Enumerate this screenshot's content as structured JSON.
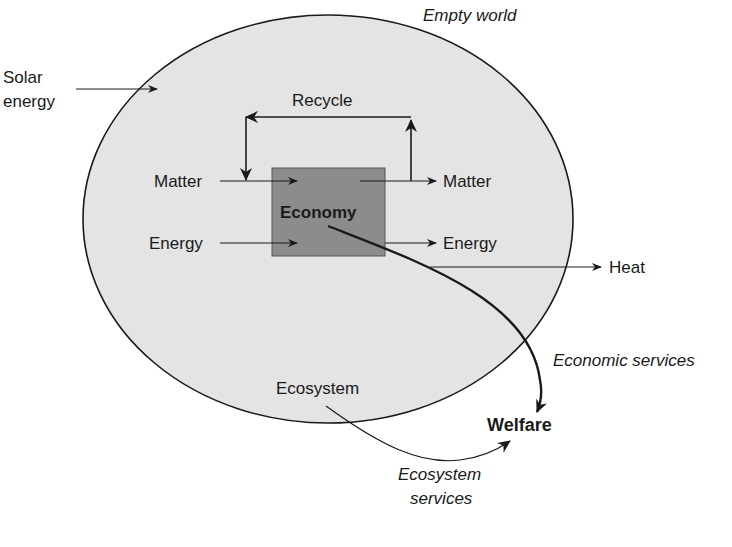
{
  "diagram": {
    "title": "Empty world",
    "colors": {
      "world_fill": "#e4e4e4",
      "economy_fill": "#8c8c8c",
      "stroke": "#1a1a1a"
    },
    "nodes": {
      "world": "Empty world",
      "economy": "Economy",
      "ecosystem": "Ecosystem",
      "welfare": "Welfare"
    },
    "labels": {
      "solar_line1": "Solar",
      "solar_line2": "energy",
      "recycle": "Recycle",
      "matter_in": "Matter",
      "matter_out": "Matter",
      "energy_in": "Energy",
      "energy_out": "Energy",
      "heat": "Heat",
      "economic_services": "Economic services",
      "ecosystem_services_line1": "Ecosystem",
      "ecosystem_services_line2": "services"
    },
    "edges": [
      {
        "from": "Solar energy",
        "to": "Empty world"
      },
      {
        "from": "Matter",
        "to": "Economy"
      },
      {
        "from": "Economy",
        "to": "Matter"
      },
      {
        "from": "Matter (out)",
        "to": "Matter (in)",
        "label": "Recycle"
      },
      {
        "from": "Energy",
        "to": "Economy"
      },
      {
        "from": "Economy",
        "to": "Energy"
      },
      {
        "from": "Economy",
        "to": "Heat"
      },
      {
        "from": "Economy",
        "to": "Welfare",
        "label": "Economic services"
      },
      {
        "from": "Ecosystem",
        "to": "Welfare",
        "label": "Ecosystem services"
      }
    ]
  }
}
